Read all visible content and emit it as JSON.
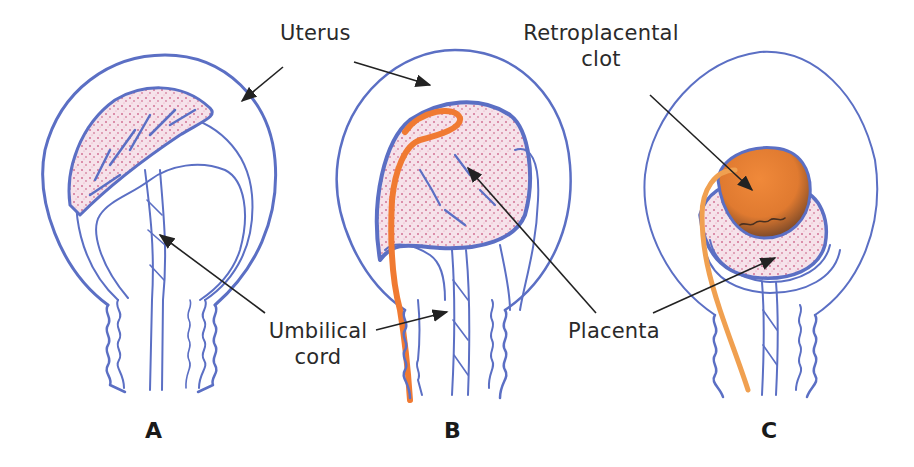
{
  "figure": {
    "colors": {
      "outline": "#5b6fc4",
      "placenta_fill": "#f3d6e0",
      "placenta_speckle": "#c2416f",
      "blood": "#f07a32",
      "clot": "#e07a30",
      "clot_dark": "#5a3a22",
      "arrow": "#222222",
      "text": "#2a2a2a"
    },
    "labels": {
      "uterus": "Uterus",
      "retroplacental_line1": "Retroplacental",
      "retroplacental_line2": "clot",
      "umbilical_line1": "Umbilical",
      "umbilical_line2": "cord",
      "placenta": "Placenta"
    },
    "panels": [
      {
        "letter": "A",
        "description": "Normal placenta attached to uterine wall"
      },
      {
        "letter": "B",
        "description": "Partial separation with bleeding"
      },
      {
        "letter": "C",
        "description": "Retroplacental clot"
      }
    ]
  }
}
